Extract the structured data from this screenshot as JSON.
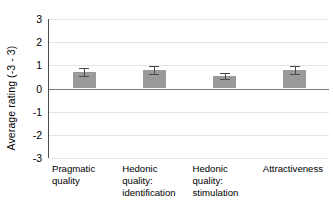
{
  "chart_data": {
    "type": "bar",
    "title": "",
    "xlabel": "",
    "ylabel": "Average rating (-3 - 3)",
    "categories": [
      "Pragmatic quality",
      "Hedonic quality: identification",
      "Hedonic quality: stimulation",
      "Attractiveness"
    ],
    "values": [
      0.72,
      0.8,
      0.55,
      0.78
    ],
    "errors": [
      0.17,
      0.17,
      0.13,
      0.17
    ],
    "ylim": [
      -3,
      3
    ],
    "yticks": [
      3,
      2,
      1,
      0,
      -1,
      -2,
      -3
    ],
    "ytick_labels": [
      "3",
      "2",
      "1",
      "0",
      "-1",
      "-2",
      "-3"
    ],
    "grid": true,
    "legend": false,
    "legend_position": "none",
    "bar_color": "#9a9a9a",
    "error_bar_color": "#4a4a4a",
    "gridline_color": "#e4e4e4",
    "axis_color": "#4d4d4d",
    "zero_line_color": "#7a7a7a",
    "background_color": "#ffffff"
  },
  "axes": {
    "y_title": "Average rating (-3 - 3)",
    "y_ticks": [
      {
        "label": "3",
        "value": 3
      },
      {
        "label": "2",
        "value": 2
      },
      {
        "label": "1",
        "value": 1
      },
      {
        "label": "0",
        "value": 0
      },
      {
        "label": "-1",
        "value": -1
      },
      {
        "label": "-2",
        "value": -2
      },
      {
        "label": "-3",
        "value": -3
      }
    ]
  },
  "x_categories": [
    {
      "line1": "Pragmatic",
      "line2": "quality",
      "line3": ""
    },
    {
      "line1": "Hedonic",
      "line2": "quality:",
      "line3": "identification"
    },
    {
      "line1": "Hedonic",
      "line2": "quality:",
      "line3": "stimulation"
    },
    {
      "line1": "Attractiveness",
      "line2": "",
      "line3": ""
    }
  ]
}
